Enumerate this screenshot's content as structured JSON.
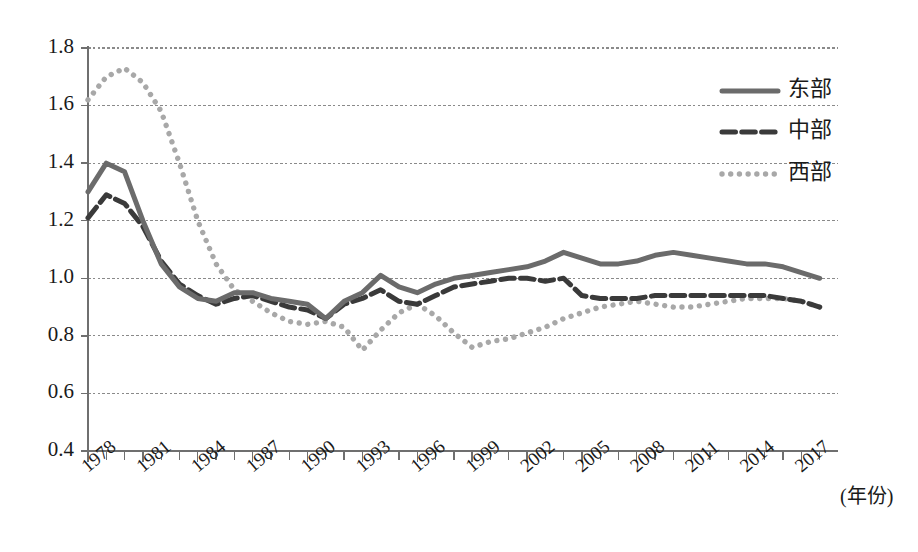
{
  "chart_data": {
    "type": "line",
    "title": "",
    "subtitle": "",
    "xlabel": "(年份)",
    "ylabel": "",
    "grid": true,
    "legend_position": "top-right",
    "xlim": [
      1978,
      2019
    ],
    "ylim": [
      0.4,
      1.8
    ],
    "ytick_labels": [
      "1.8",
      "1.6",
      "1.4",
      "1.2",
      "1.0",
      "0.8",
      "0.6",
      "0.4"
    ],
    "ytick_values": [
      1.8,
      1.6,
      1.4,
      1.2,
      1.0,
      0.8,
      0.6,
      0.4
    ],
    "xtick_labels": [
      "1978",
      "1981",
      "1984",
      "1987",
      "1990",
      "1993",
      "1996",
      "1999",
      "2002",
      "2005",
      "2008",
      "2011",
      "2014",
      "2017"
    ],
    "xtick_values": [
      1978,
      1981,
      1984,
      1987,
      1990,
      1993,
      1996,
      1999,
      2002,
      2005,
      2008,
      2011,
      2014,
      2017
    ],
    "x": [
      1978,
      1979,
      1980,
      1981,
      1982,
      1983,
      1984,
      1985,
      1986,
      1987,
      1988,
      1989,
      1990,
      1991,
      1992,
      1993,
      1994,
      1995,
      1996,
      1997,
      1998,
      1999,
      2000,
      2001,
      2002,
      2003,
      2004,
      2005,
      2006,
      2007,
      2008,
      2009,
      2010,
      2011,
      2012,
      2013,
      2014,
      2015,
      2016,
      2017,
      2018
    ],
    "series": [
      {
        "name": "东部",
        "style": "solid",
        "color": "#6b6b6b",
        "width": 5.0,
        "values": [
          1.3,
          1.4,
          1.37,
          1.2,
          1.05,
          0.97,
          0.93,
          0.92,
          0.95,
          0.95,
          0.93,
          0.92,
          0.91,
          0.86,
          0.92,
          0.95,
          1.01,
          0.97,
          0.95,
          0.98,
          1.0,
          1.01,
          1.02,
          1.03,
          1.04,
          1.06,
          1.09,
          1.07,
          1.05,
          1.05,
          1.06,
          1.08,
          1.09,
          1.08,
          1.07,
          1.06,
          1.05,
          1.05,
          1.04,
          1.02,
          1.0
        ]
      },
      {
        "name": "中部",
        "style": "dashed",
        "color": "#3a3a3a",
        "width": 5.0,
        "values": [
          1.21,
          1.29,
          1.26,
          1.18,
          1.06,
          0.98,
          0.94,
          0.91,
          0.93,
          0.94,
          0.92,
          0.9,
          0.89,
          0.86,
          0.91,
          0.93,
          0.96,
          0.92,
          0.91,
          0.94,
          0.97,
          0.98,
          0.99,
          1.0,
          1.0,
          0.99,
          1.0,
          0.94,
          0.93,
          0.93,
          0.93,
          0.94,
          0.94,
          0.94,
          0.94,
          0.94,
          0.94,
          0.94,
          0.93,
          0.92,
          0.9
        ]
      },
      {
        "name": "西部",
        "style": "dotted",
        "color": "#a8a8a8",
        "width": 5.4,
        "values": [
          1.62,
          1.7,
          1.73,
          1.68,
          1.58,
          1.4,
          1.2,
          1.05,
          0.96,
          0.92,
          0.88,
          0.85,
          0.84,
          0.85,
          0.83,
          0.75,
          0.82,
          0.88,
          0.91,
          0.87,
          0.81,
          0.76,
          0.78,
          0.79,
          0.81,
          0.83,
          0.86,
          0.88,
          0.9,
          0.91,
          0.92,
          0.91,
          0.9,
          0.9,
          0.91,
          0.92,
          0.93,
          0.93,
          0.93,
          0.92,
          0.9
        ]
      }
    ],
    "legend_entries": [
      {
        "label": "东部",
        "style": "solid",
        "color": "#6b6b6b"
      },
      {
        "label": "中部",
        "style": "dashed",
        "color": "#3a3a3a"
      },
      {
        "label": "西部",
        "style": "dotted",
        "color": "#a8a8a8"
      }
    ]
  },
  "plot": {
    "left": 88,
    "right": 838,
    "top": 48,
    "bottom": 451
  },
  "legend_layout": {
    "sample_x1": 722,
    "sample_x2": 778,
    "label_x": 788,
    "rows_y": [
      91,
      132,
      174
    ]
  }
}
